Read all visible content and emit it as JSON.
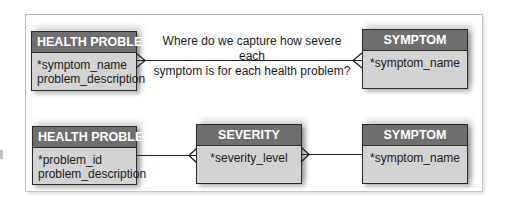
{
  "diagram": {
    "question": {
      "line1": "Where do we capture how severe each",
      "line2": "symptom is for each health problem?"
    },
    "top_row": {
      "health_problem": {
        "title": "HEALTH PROBLEM",
        "attributes": [
          "*symptom_name",
          "problem_description"
        ]
      },
      "symptom": {
        "title": "SYMPTOM",
        "attributes": [
          "*symptom_name"
        ]
      },
      "relationship": {
        "from": "HEALTH PROBLEM",
        "to": "SYMPTOM",
        "cardinality": "many-to-many"
      }
    },
    "bottom_row": {
      "health_problem": {
        "title": "HEALTH PROBLEM",
        "attributes": [
          "*problem_id",
          "problem_description"
        ]
      },
      "severity": {
        "title": "SEVERITY",
        "attributes": [
          "*severity_level"
        ]
      },
      "symptom": {
        "title": "SYMPTOM",
        "attributes": [
          "*symptom_name"
        ]
      },
      "relationships": [
        {
          "from": "HEALTH PROBLEM",
          "to": "SEVERITY",
          "cardinality": "one-to-many"
        },
        {
          "from": "SYMPTOM",
          "to": "SEVERITY",
          "cardinality": "one-to-many"
        }
      ]
    },
    "colors": {
      "header_fill": "#6f6f6f",
      "body_fill": "#d3d3d3",
      "border": "#2a2a2a",
      "header_text": "#ffffff"
    }
  }
}
